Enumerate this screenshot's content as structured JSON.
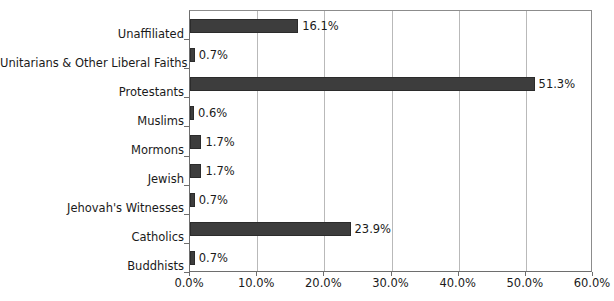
{
  "chart_data": {
    "type": "bar",
    "orientation": "horizontal",
    "title": "",
    "subtitle": "",
    "xlabel": "",
    "ylabel": "",
    "categories": [
      "Unaffiliated",
      "Unitarians & Other Liberal Faiths",
      "Protestants",
      "Muslims",
      "Mormons",
      "Jewish",
      "Jehovah's Witnesses",
      "Catholics",
      "Buddhists"
    ],
    "values": [
      16.1,
      0.7,
      51.3,
      0.6,
      1.7,
      1.7,
      0.7,
      23.9,
      0.7
    ],
    "value_labels": [
      "16.1%",
      "0.7%",
      "51.3%",
      "0.6%",
      "1.7%",
      "1.7%",
      "0.7%",
      "23.9%",
      "0.7%"
    ],
    "xlim": [
      0,
      60
    ],
    "x_tick_values": [
      0,
      10,
      20,
      30,
      40,
      50,
      60
    ],
    "x_tick_labels": [
      "0.0%",
      "10.0%",
      "20.0%",
      "30.0%",
      "40.0%",
      "50.0%",
      "60.0%"
    ],
    "grid": "vertical",
    "legend": "none",
    "bar_color": "#3d3d3d",
    "gridline_color": "#b9b9b9",
    "axis_color": "#6e6e6e",
    "background_color": "#ffffff"
  }
}
